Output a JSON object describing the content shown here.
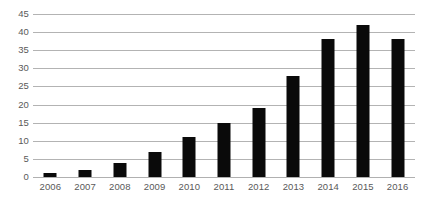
{
  "chart_data": {
    "type": "bar",
    "title": "",
    "subtitle": "",
    "xlabel": "",
    "ylabel": "",
    "categories": [
      "2006",
      "2007",
      "2008",
      "2009",
      "2010",
      "2011",
      "2012",
      "2013",
      "2014",
      "2015",
      "2016"
    ],
    "values": [
      1,
      2,
      4,
      7,
      11,
      15,
      19,
      28,
      38,
      42,
      38
    ],
    "ylim": [
      0,
      45
    ],
    "ytick_step": 5,
    "yticks": [
      0,
      5,
      10,
      15,
      20,
      25,
      30,
      35,
      40,
      45
    ],
    "ytick_labels": [
      "0",
      "5",
      "10",
      "15",
      "20",
      "25",
      "30",
      "35",
      "40",
      "45"
    ],
    "grid": "horizontal",
    "legend": "none",
    "annotations": [],
    "colors": {
      "bar": "#0a0a0a",
      "gridline": "#b3b3b3",
      "tick_label": "#595959",
      "background": "#ffffff"
    }
  }
}
